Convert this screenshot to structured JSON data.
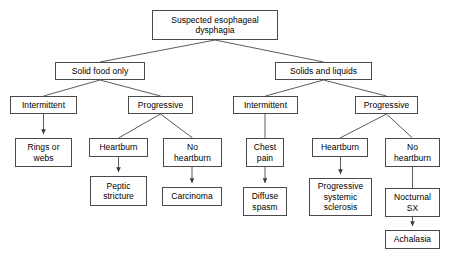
{
  "diagram": {
    "type": "flowchart",
    "background_color": "#ffffff",
    "box_border_color": "#4a4a4a",
    "box_fill_color": "#ffffff",
    "text_color": "#000000",
    "edge_color": "#4a4a4a",
    "nodes": [
      {
        "id": "root",
        "label": "Suspected esophageal\ndysphagia",
        "x": 152,
        "y": 10,
        "w": 126,
        "h": 30,
        "level": 0
      },
      {
        "id": "solid",
        "label": "Solid food only",
        "x": 55,
        "y": 62,
        "w": 90,
        "h": 18,
        "level": 1
      },
      {
        "id": "solids_liquids",
        "label": "Solids and liquids",
        "x": 275,
        "y": 62,
        "w": 97,
        "h": 18,
        "level": 1
      },
      {
        "id": "interm_l",
        "label": "Intermittent",
        "x": 10,
        "y": 96,
        "w": 67,
        "h": 18,
        "level": 2
      },
      {
        "id": "progr_l",
        "label": "Progressive",
        "x": 128,
        "y": 96,
        "w": 65,
        "h": 18,
        "level": 2
      },
      {
        "id": "interm_r",
        "label": "Intermittent",
        "x": 233,
        "y": 96,
        "w": 65,
        "h": 18,
        "level": 2
      },
      {
        "id": "progr_r",
        "label": "Progressive",
        "x": 355,
        "y": 96,
        "w": 63,
        "h": 18,
        "level": 2
      },
      {
        "id": "rings",
        "label": "Rings or\nwebs",
        "x": 15,
        "y": 138,
        "w": 57,
        "h": 29,
        "level": 3
      },
      {
        "id": "heartburn_l",
        "label": "Heartburn",
        "x": 89,
        "y": 138,
        "w": 59,
        "h": 19,
        "level": 3
      },
      {
        "id": "no_heartburn_l",
        "label": "No\nheartburn",
        "x": 163,
        "y": 138,
        "w": 59,
        "h": 29,
        "level": 3
      },
      {
        "id": "chest_pain",
        "label": "Chest\npain",
        "x": 246,
        "y": 138,
        "w": 38,
        "h": 29,
        "level": 3
      },
      {
        "id": "heartburn_r",
        "label": "Heartburn",
        "x": 312,
        "y": 138,
        "w": 56,
        "h": 19,
        "level": 3
      },
      {
        "id": "no_heartburn_r",
        "label": "No\nheartburn",
        "x": 385,
        "y": 138,
        "w": 55,
        "h": 29,
        "level": 3
      },
      {
        "id": "peptic",
        "label": "Peptic\nstricture",
        "x": 90,
        "y": 176,
        "w": 57,
        "h": 30,
        "level": 4
      },
      {
        "id": "carcinoma",
        "label": "Carcinoma",
        "x": 162,
        "y": 187,
        "w": 60,
        "h": 19,
        "level": 4
      },
      {
        "id": "diffuse",
        "label": "Diffuse\nspasm",
        "x": 243,
        "y": 187,
        "w": 44,
        "h": 29,
        "level": 4
      },
      {
        "id": "pss",
        "label": "Progressive\nsystemic\nsclerosis",
        "x": 309,
        "y": 178,
        "w": 63,
        "h": 38,
        "level": 4
      },
      {
        "id": "nocturnal",
        "label": "Nocturnal\nSX",
        "x": 385,
        "y": 188,
        "w": 55,
        "h": 29,
        "level": 4
      },
      {
        "id": "achalasia",
        "label": "Achalasia",
        "x": 385,
        "y": 230,
        "w": 55,
        "h": 19,
        "level": 5
      }
    ],
    "edges": [
      {
        "id": "e-root-solid",
        "from": "root",
        "to": "solid",
        "style": "fork",
        "arrow": false
      },
      {
        "id": "e-root-solids-liquids",
        "from": "root",
        "to": "solids_liquids",
        "style": "fork",
        "arrow": false
      },
      {
        "id": "e-solid-interm",
        "from": "solid",
        "to": "interm_l",
        "style": "fork",
        "arrow": false
      },
      {
        "id": "e-solid-progr",
        "from": "solid",
        "to": "progr_l",
        "style": "fork",
        "arrow": false
      },
      {
        "id": "e-sl-interm",
        "from": "solids_liquids",
        "to": "interm_r",
        "style": "fork",
        "arrow": false
      },
      {
        "id": "e-sl-progr",
        "from": "solids_liquids",
        "to": "progr_r",
        "style": "fork",
        "arrow": false
      },
      {
        "id": "e-interml-rings",
        "from": "interm_l",
        "to": "rings",
        "style": "line",
        "arrow": true
      },
      {
        "id": "e-progrl-heartburn",
        "from": "progr_l",
        "to": "heartburn_l",
        "style": "fork",
        "arrow": false
      },
      {
        "id": "e-progrl-noheartburn",
        "from": "progr_l",
        "to": "no_heartburn_l",
        "style": "fork",
        "arrow": false
      },
      {
        "id": "e-intermr-chest",
        "from": "interm_r",
        "to": "chest_pain",
        "style": "line",
        "arrow": false
      },
      {
        "id": "e-progrr-heartburn",
        "from": "progr_r",
        "to": "heartburn_r",
        "style": "fork",
        "arrow": false
      },
      {
        "id": "e-progrr-noheartburn",
        "from": "progr_r",
        "to": "no_heartburn_r",
        "style": "fork",
        "arrow": false
      },
      {
        "id": "e-heartburnl-peptic",
        "from": "heartburn_l",
        "to": "peptic",
        "style": "line",
        "arrow": true
      },
      {
        "id": "e-nohbl-carcinoma",
        "from": "no_heartburn_l",
        "to": "carcinoma",
        "style": "line",
        "arrow": true
      },
      {
        "id": "e-chest-diffuse",
        "from": "chest_pain",
        "to": "diffuse",
        "style": "line",
        "arrow": true
      },
      {
        "id": "e-heartburnr-pss",
        "from": "heartburn_r",
        "to": "pss",
        "style": "line",
        "arrow": true
      },
      {
        "id": "e-nohbr-nocturnal",
        "from": "no_heartburn_r",
        "to": "nocturnal",
        "style": "line",
        "arrow": false
      },
      {
        "id": "e-nocturnal-achalasia",
        "from": "nocturnal",
        "to": "achalasia",
        "style": "line",
        "arrow": true
      }
    ]
  }
}
